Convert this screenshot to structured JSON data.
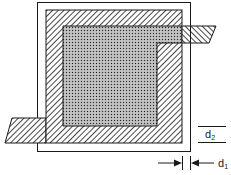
{
  "diagram": {
    "type": "layered-plate-cross-section",
    "colors": {
      "line": "#1a1a1a",
      "background": "#ffffff",
      "hatch": "#1a1a1a",
      "crosshatch_fill": "#9a9a9a"
    },
    "regions": [
      {
        "name": "outer-frame",
        "fill": "none"
      },
      {
        "name": "hatched-layer",
        "fill": "diagonal-hatch"
      },
      {
        "name": "crosshatched-core",
        "fill": "crosshatch"
      },
      {
        "name": "right-lead-tab",
        "fill": "reverse-diagonal-hatch"
      },
      {
        "name": "left-lead-tab",
        "fill": "diagonal-hatch"
      }
    ],
    "dimensions": {
      "d1": {
        "label": "d",
        "subscript": "1",
        "description": "gap between hatched layer edge and outer frame"
      },
      "d2": {
        "label": "d",
        "subscript": "2",
        "description": "vertical spacing indicator"
      }
    }
  }
}
